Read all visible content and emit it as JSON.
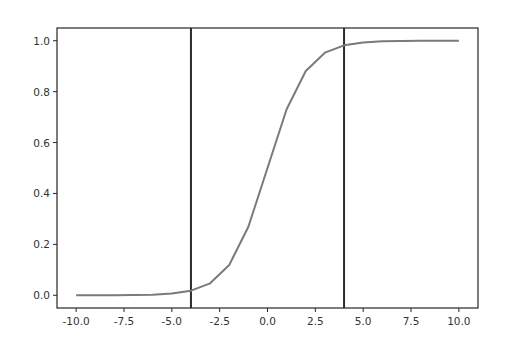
{
  "chart_data": {
    "type": "line",
    "title": "",
    "xlabel": "",
    "ylabel": "",
    "xlim": [
      -11.0,
      11.0
    ],
    "ylim": [
      -0.05,
      1.05
    ],
    "grid": false,
    "legend": null,
    "x_ticks": [
      -10.0,
      -7.5,
      -5.0,
      -2.5,
      0.0,
      2.5,
      5.0,
      7.5,
      10.0
    ],
    "x_tick_labels": [
      "-10.0",
      "-7.5",
      "-5.0",
      "-2.5",
      "0.0",
      "2.5",
      "5.0",
      "7.5",
      "10.0"
    ],
    "y_ticks": [
      0.0,
      0.2,
      0.4,
      0.6,
      0.8,
      1.0
    ],
    "y_tick_labels": [
      "0.0",
      "0.2",
      "0.4",
      "0.6",
      "0.8",
      "1.0"
    ],
    "series": [
      {
        "name": "sigmoid",
        "color": "#7a7a7a",
        "x": [
          -10,
          -9,
          -8,
          -7,
          -6,
          -5,
          -4,
          -3,
          -2,
          -1,
          0,
          1,
          2,
          3,
          4,
          5,
          6,
          7,
          8,
          9,
          10
        ],
        "y": [
          5e-05,
          0.00012,
          0.00034,
          0.00091,
          0.00247,
          0.00669,
          0.018,
          0.047,
          0.119,
          0.269,
          0.5,
          0.731,
          0.881,
          0.953,
          0.982,
          0.993,
          0.998,
          0.999,
          0.9997,
          0.9999,
          0.99995
        ]
      }
    ],
    "annotations": [
      {
        "type": "vline",
        "x": -4.0,
        "color": "#2b2b2b"
      },
      {
        "type": "vline",
        "x": 4.0,
        "color": "#2b2b2b"
      }
    ]
  },
  "layout": {
    "plot_left": 57,
    "plot_top": 28,
    "plot_right": 478,
    "plot_bottom": 308
  }
}
